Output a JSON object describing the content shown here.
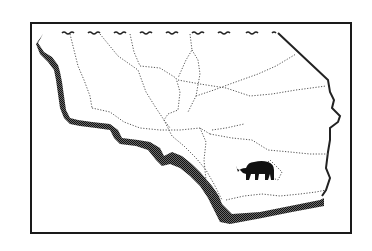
{
  "map": {
    "subject": "Southern California counties",
    "frame_color": "#1a1a1a",
    "coast_shadow_color": "#3a3a3a",
    "border_color": "#222222",
    "county_line_color": "#555555",
    "icon": "bear-icon"
  }
}
